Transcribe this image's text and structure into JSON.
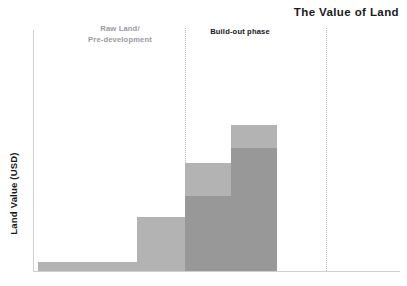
{
  "chart_data": {
    "type": "bar",
    "title": "The Value of Land",
    "xlabel": "",
    "ylabel": "Land Value (USD)",
    "grid": false,
    "legend_position": "none",
    "axis_ranges": {
      "y_min": 0,
      "y_max": 100,
      "y_axis_ticks_shown": false,
      "x_axis_ticks_shown": false
    },
    "categories": [
      "Stage 1",
      "Stage 2",
      "Stage 3",
      "Stage 4"
    ],
    "series": [
      {
        "name": "Developed value base",
        "values": [
          0,
          0,
          31,
          52
        ]
      },
      {
        "name": "Land value uplift",
        "values": [
          4,
          22,
          14,
          10
        ]
      }
    ],
    "totals": [
      4,
      22,
      45,
      62
    ],
    "colors": {
      "light_grey": "#b3b3b3",
      "dark_grey": "#989898",
      "axis_grey": "#cfcfcf",
      "divider_grey": "#b9b9b9",
      "title_text": "#1a1a22",
      "muted_text": "#9a9aa2"
    },
    "annotations": [
      {
        "text": "Raw Land/\nPre-development",
        "phase": "raw-land",
        "color": "#9a9aa2"
      },
      {
        "text": "Build-out phase",
        "phase": "build-out",
        "color": "#16161c"
      }
    ],
    "dividers": [
      {
        "name": "build-out-start",
        "x_fraction": 0.41
      },
      {
        "name": "stabilized-start",
        "x_fraction": 0.8
      }
    ]
  },
  "labels": {
    "title": "The Value of Land",
    "y_axis": "Land Value (USD)",
    "phase_raw": "Raw Land/\nPre-development",
    "phase_buildout": "Build-out phase"
  },
  "bars": [
    {
      "name": "bar-stage-1",
      "left": 38,
      "width": 99,
      "dark_top": 262,
      "light_top": 262,
      "bottom": 271
    },
    {
      "name": "bar-stage-2",
      "left": 137,
      "width": 48,
      "dark_top": 217,
      "light_top": 217,
      "bottom": 271
    },
    {
      "name": "bar-stage-3",
      "left": 185,
      "width": 46,
      "dark_top": 196,
      "light_top": 163,
      "bottom": 271
    },
    {
      "name": "bar-stage-4",
      "left": 231,
      "width": 46,
      "dark_top": 148,
      "light_top": 125,
      "bottom": 271
    }
  ]
}
